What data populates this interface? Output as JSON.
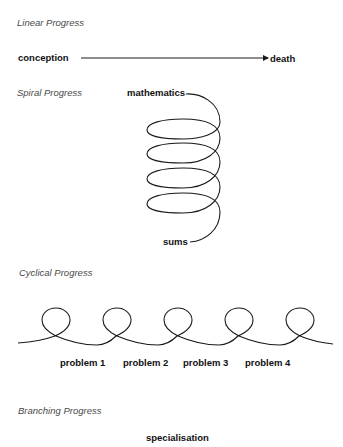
{
  "sections": {
    "linear": {
      "heading": "Linear Progress",
      "start_label": "conception",
      "end_label": "death"
    },
    "spiral": {
      "heading": "Spiral Progress",
      "top_label": "mathematics",
      "bottom_label": "sums",
      "loops": 4
    },
    "cyclical": {
      "heading": "Cyclical Progress",
      "loops": 5,
      "labels": [
        "problem 1",
        "problem 2",
        "problem 3",
        "problem 4"
      ]
    },
    "branching": {
      "heading": "Branching Progress",
      "top_label": "specialisation"
    }
  },
  "colors": {
    "line": "#1a1a1a",
    "heading": "#4a4a4a",
    "label": "#111111",
    "background": "#ffffff"
  }
}
